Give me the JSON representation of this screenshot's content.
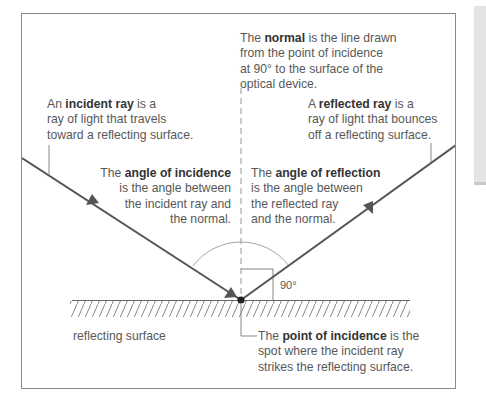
{
  "diagram": {
    "colors": {
      "ray": "#555555",
      "frame": "#8a8a8a",
      "normal_dashed": "#888888",
      "arc": "#999999",
      "text": "#585858",
      "bold_text": "#333333",
      "side_panel": "#e4e4e4"
    },
    "labels": {
      "normal": {
        "pre": "The ",
        "bold": "normal",
        "line1_post": " is the line drawn",
        "line2": "from the point of incidence",
        "line3": "at 90° to the surface of the",
        "line4": "optical device."
      },
      "incident_ray": {
        "pre": "An ",
        "bold": "incident ray",
        "line1_post": " is a",
        "line2": "ray of light that travels",
        "line3": "toward a reflecting surface."
      },
      "reflected_ray": {
        "pre": "A ",
        "bold": "reflected ray",
        "line1_post": " is a",
        "line2": "ray of light that bounces",
        "line3": "off a reflecting surface."
      },
      "angle_of_incidence": {
        "pre": "The ",
        "bold": "angle of incidence",
        "line2": "is the angle between",
        "line3": "the incident ray and",
        "line4": "the normal."
      },
      "angle_of_reflection": {
        "pre": "The ",
        "bold": "angle of reflection",
        "line2": "is the angle between",
        "line3": "the reflected ray",
        "line4": "and the normal."
      },
      "right_angle": "90°",
      "reflecting_surface": "reflecting surface",
      "point_of_incidence": {
        "pre": "The ",
        "bold": "point of incidence",
        "line1_post": " is the",
        "line2": "spot where the incident ray",
        "line3": "strikes the reflecting surface."
      }
    }
  }
}
